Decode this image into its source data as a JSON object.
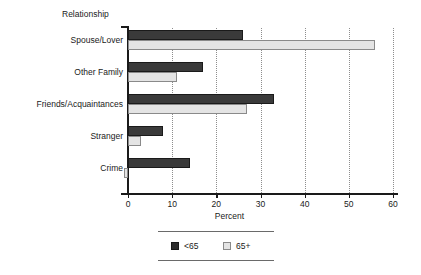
{
  "chart_data": {
    "type": "bar",
    "orientation": "horizontal",
    "title": "",
    "xlabel": "Percent",
    "ylabel": "Relationship",
    "categories": [
      "Spouse/Lover",
      "Other Family",
      "Friends/Acquaintances",
      "Stranger",
      "Crime"
    ],
    "series": [
      {
        "name": "<65",
        "color": "#3a3a3a",
        "values": [
          26,
          17,
          33,
          8,
          14
        ]
      },
      {
        "name": "65+",
        "color": "#e4e4e4",
        "values": [
          56,
          11,
          27,
          3,
          -1
        ]
      }
    ],
    "xlim": [
      0,
      60
    ],
    "xticks": [
      0,
      10,
      20,
      30,
      40,
      50,
      60
    ],
    "xtick_labels": [
      "0",
      "10",
      "20",
      "30",
      "40",
      "50",
      "60"
    ],
    "grid": "vertical-dotted",
    "legend_position": "bottom-center",
    "legend_entries": [
      "<65",
      "65+"
    ]
  },
  "axes": {
    "y_title": "Relationship",
    "x_title": "Percent"
  }
}
